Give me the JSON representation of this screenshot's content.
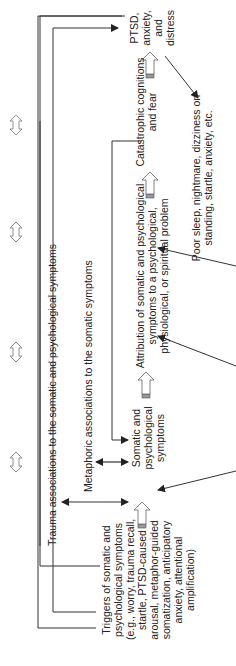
{
  "diagram": {
    "nodes": {
      "triggers": {
        "lines": [
          "Triggers of somatic and",
          "psychological symptoms",
          "(e.g., worry, trauma recall,",
          "startle, PTSD-caused",
          "arousal, metaphor-guided",
          "somatization, anticipatory",
          "anxiety, attentional",
          "amplification)"
        ]
      },
      "somatic": {
        "lines": [
          "Somatic and",
          "psychological",
          "symptoms"
        ]
      },
      "attribution": {
        "lines": [
          "Attribution of somatic and psychological",
          "symptoms to a psychological,",
          "physiological, or spiritual problem"
        ]
      },
      "catastrophic": {
        "lines": [
          "Catastrophic cognitions",
          "and fear"
        ]
      },
      "ptsd": {
        "lines": [
          "PTSD,",
          "anxiety,",
          "and",
          "distress"
        ]
      },
      "poor_sleep": {
        "lines": [
          "Poor sleep, nightmare, dizziness on",
          "standing, startle, anxiety, etc."
        ]
      }
    },
    "edge_labels": {
      "trauma": "Trauma associations to the somatic and psychological symptoms",
      "metaphoric": "Metaphoric associations to the somatic symptoms"
    },
    "colors": {
      "line": "#333333",
      "text": "#222222",
      "hollow_arrow": "#888888"
    }
  }
}
